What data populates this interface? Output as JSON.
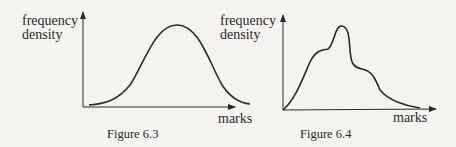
{
  "figures": [
    {
      "caption": "Figure 6.3",
      "ylabel_line1": "frequency",
      "ylabel_line2": "density",
      "xlabel": "marks",
      "shape": "symmetric unimodal (bell-shaped) curve"
    },
    {
      "caption": "Figure 6.4",
      "ylabel_line1": "frequency",
      "ylabel_line2": "density",
      "xlabel": "marks",
      "shape": "multimodal curve with a central peak and two shoulders, skewed tail to the right"
    }
  ],
  "colors": {
    "background": "#f4f3f0",
    "ink": "#2a2a2a"
  }
}
